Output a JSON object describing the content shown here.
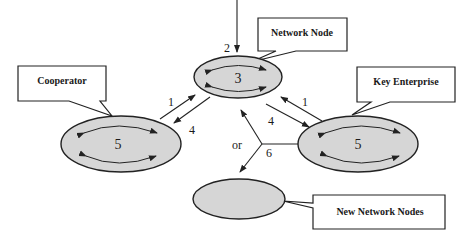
{
  "colors": {
    "node_fill": "#d6d6d6",
    "stroke": "#222222",
    "background": "#ffffff"
  },
  "callouts": {
    "network_node": "Network Node",
    "cooperator": "Cooperator",
    "key_enterprise": "Key Enterprise",
    "new_network_nodes": "New Network Nodes"
  },
  "nodes": {
    "network_node": "3",
    "cooperator": "5",
    "key_enterprise": "5",
    "new_network_nodes": ""
  },
  "edges": {
    "incoming_top": "2",
    "cooperator_to_network": "1",
    "network_to_cooperator": "4",
    "key_to_network": "1",
    "network_to_key": "4",
    "split": "6",
    "or_label": "or"
  }
}
